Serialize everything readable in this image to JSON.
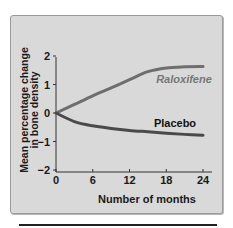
{
  "chart_data": {
    "type": "line",
    "title": "",
    "xlabel": "Number of months",
    "ylabel": "Mean percentage change in bone density",
    "ylabel_lines": [
      "Mean percentage change",
      "in bone density"
    ],
    "x_ticks": [
      0,
      6,
      12,
      18,
      24
    ],
    "y_ticks": [
      2,
      1,
      0,
      -1,
      -2
    ],
    "xlim": [
      0,
      24
    ],
    "ylim": [
      -2,
      2
    ],
    "grid": false,
    "legend": "inline labels",
    "x": [
      0,
      3,
      6,
      9,
      12,
      15,
      18,
      21,
      24
    ],
    "series": [
      {
        "name": "Raloxifene",
        "values": [
          0,
          0.3,
          0.6,
          0.88,
          1.17,
          1.45,
          1.58,
          1.62,
          1.63
        ],
        "color": "#6e6e6e",
        "label_style": "italic"
      },
      {
        "name": "Placebo",
        "values": [
          0,
          -0.3,
          -0.45,
          -0.54,
          -0.61,
          -0.66,
          -0.71,
          -0.75,
          -0.78
        ],
        "color": "#4a4a4a",
        "label_style": "normal"
      }
    ]
  },
  "labels": {
    "xlabel": "Number of months",
    "ylabel_line1": "Mean percentage change",
    "ylabel_line2": "in bone density",
    "raloxifene": "Raloxifene",
    "placebo": "Placebo",
    "xticks": [
      "0",
      "6",
      "12",
      "18",
      "24"
    ],
    "yticks": [
      "2",
      "1",
      "0",
      "−1",
      "−2"
    ]
  },
  "colors": {
    "panel_bg": "#d9d9d9",
    "axis": "#333333",
    "raloxifene": "#6e6e6e",
    "placebo": "#4a4a4a"
  }
}
